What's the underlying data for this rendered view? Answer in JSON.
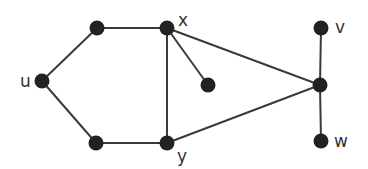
{
  "graph": {
    "nodes": [
      {
        "id": "u",
        "label": "u",
        "x": 42,
        "y": 81,
        "lx": 20,
        "ly": 87
      },
      {
        "id": "a",
        "label": "",
        "x": 97,
        "y": 28
      },
      {
        "id": "x",
        "label": "x",
        "x": 167,
        "y": 28,
        "lx": 178,
        "ly": 26
      },
      {
        "id": "b",
        "label": "",
        "x": 96,
        "y": 143
      },
      {
        "id": "y",
        "label": "y",
        "x": 167,
        "y": 143,
        "lx": 177,
        "ly": 162
      },
      {
        "id": "c",
        "label": "",
        "x": 208,
        "y": 85
      },
      {
        "id": "h",
        "label": "",
        "x": 320,
        "y": 85
      },
      {
        "id": "v",
        "label": "v",
        "x": 321,
        "y": 28,
        "lx": 335,
        "ly": 33
      },
      {
        "id": "w",
        "label": "w",
        "x": 321,
        "y": 141,
        "lx": 334,
        "ly": 147
      }
    ],
    "edges": [
      [
        "u",
        "a"
      ],
      [
        "a",
        "x"
      ],
      [
        "u",
        "b"
      ],
      [
        "b",
        "y"
      ],
      [
        "x",
        "y"
      ],
      [
        "x",
        "c"
      ],
      [
        "x",
        "h"
      ],
      [
        "y",
        "h"
      ],
      [
        "v",
        "h"
      ],
      [
        "h",
        "w"
      ]
    ]
  }
}
